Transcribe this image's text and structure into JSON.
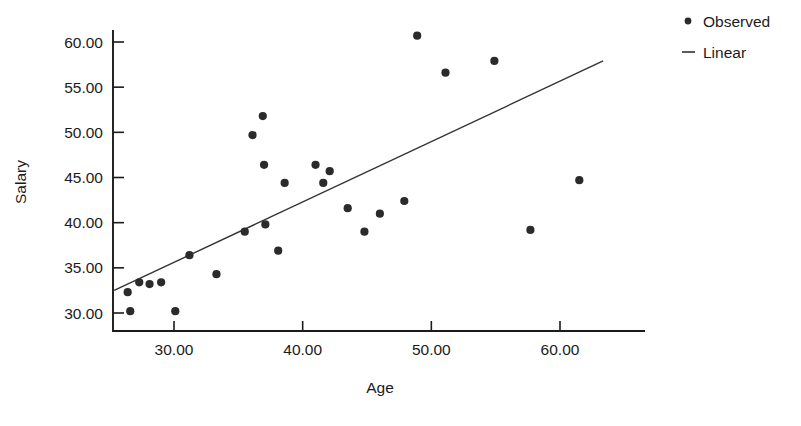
{
  "chart_data": {
    "type": "scatter",
    "title": "",
    "xlabel": "Age",
    "ylabel": "Salary",
    "xlim": [
      25.0,
      63.5
    ],
    "ylim": [
      27.5,
      61.5
    ],
    "grid": false,
    "legend_position": "top-right",
    "xticks": [
      30,
      40,
      50,
      60
    ],
    "xtick_labels": [
      "30.00",
      "40.00",
      "50.00",
      "60.00"
    ],
    "yticks": [
      30,
      35,
      40,
      45,
      50,
      55,
      60
    ],
    "ytick_labels": [
      "30.00",
      "35.00",
      "40.00",
      "45.00",
      "50.00",
      "55.00",
      "60.00"
    ],
    "series": [
      {
        "name": "Observed",
        "type": "scatter",
        "marker": "circle",
        "color": "#2b2b2b",
        "points": [
          {
            "x": 26.4,
            "y": 32.3
          },
          {
            "x": 26.6,
            "y": 30.2
          },
          {
            "x": 27.3,
            "y": 33.4
          },
          {
            "x": 28.1,
            "y": 33.2
          },
          {
            "x": 29.0,
            "y": 33.4
          },
          {
            "x": 30.1,
            "y": 30.2
          },
          {
            "x": 31.2,
            "y": 36.4
          },
          {
            "x": 33.3,
            "y": 34.3
          },
          {
            "x": 35.5,
            "y": 39.0
          },
          {
            "x": 36.1,
            "y": 49.7
          },
          {
            "x": 36.9,
            "y": 51.8
          },
          {
            "x": 37.0,
            "y": 46.4
          },
          {
            "x": 37.1,
            "y": 39.8
          },
          {
            "x": 38.1,
            "y": 36.9
          },
          {
            "x": 38.6,
            "y": 44.4
          },
          {
            "x": 41.0,
            "y": 46.4
          },
          {
            "x": 41.6,
            "y": 44.4
          },
          {
            "x": 42.1,
            "y": 45.7
          },
          {
            "x": 43.5,
            "y": 41.6
          },
          {
            "x": 44.8,
            "y": 39.0
          },
          {
            "x": 46.0,
            "y": 41.0
          },
          {
            "x": 47.9,
            "y": 42.4
          },
          {
            "x": 48.9,
            "y": 60.7
          },
          {
            "x": 51.1,
            "y": 56.6
          },
          {
            "x": 54.9,
            "y": 57.9
          },
          {
            "x": 57.7,
            "y": 39.2
          },
          {
            "x": 61.5,
            "y": 44.7
          }
        ]
      },
      {
        "name": "Linear",
        "type": "line",
        "color": "#333333",
        "endpoints": [
          {
            "x": 25.35,
            "y": 32.5
          },
          {
            "x": 63.35,
            "y": 57.9
          }
        ]
      }
    ]
  },
  "legend": {
    "items": [
      {
        "label": "Observed",
        "marker": "dot"
      },
      {
        "label": "Linear",
        "marker": "line"
      }
    ]
  }
}
